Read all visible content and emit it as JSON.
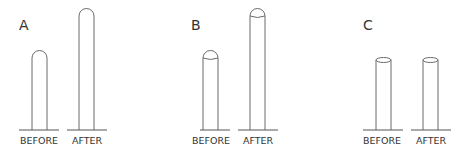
{
  "diagram": {
    "stroke_color": "#6a6a6a",
    "panels": [
      {
        "id": "A",
        "label": "A",
        "top_shape": "rounded",
        "columns": [
          {
            "label": "BEFORE",
            "height": "short"
          },
          {
            "label": "AFTER",
            "height": "tall"
          }
        ]
      },
      {
        "id": "B",
        "label": "B",
        "top_shape": "dome-cap",
        "columns": [
          {
            "label": "BEFORE",
            "height": "short"
          },
          {
            "label": "AFTER",
            "height": "tall"
          }
        ]
      },
      {
        "id": "C",
        "label": "C",
        "top_shape": "flat-ellipse",
        "columns": [
          {
            "label": "BEFORE",
            "height": "equal"
          },
          {
            "label": "AFTER",
            "height": "equal"
          }
        ]
      }
    ]
  }
}
